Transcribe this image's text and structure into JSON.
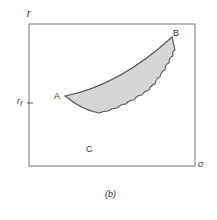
{
  "diagram": {
    "y_axis_label": "r",
    "x_axis_label": "σ",
    "tick_label": "r",
    "tick_subscript": "f",
    "points": [
      {
        "id": "A",
        "label": "A"
      },
      {
        "id": "B",
        "label": "B"
      },
      {
        "id": "C",
        "label": "C"
      }
    ],
    "caption": "(b)",
    "colors": {
      "fill": "#d6d6d6",
      "stroke": "#555555",
      "frame": "#777777"
    }
  }
}
